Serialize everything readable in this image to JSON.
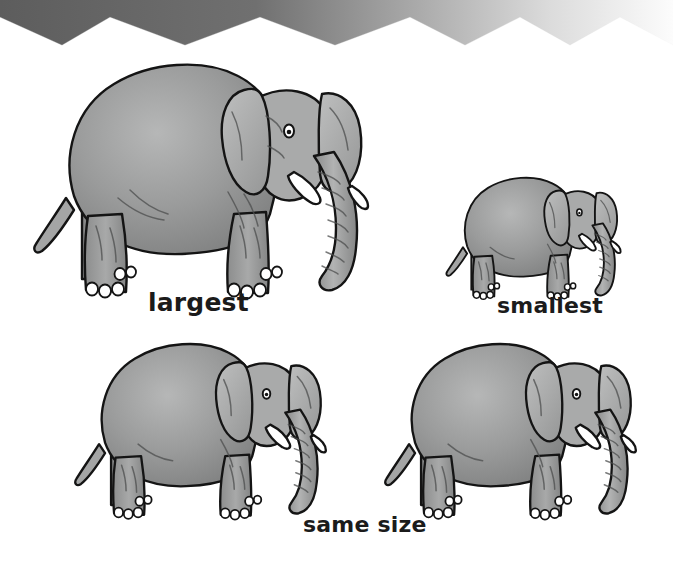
{
  "page": {
    "width": 673,
    "height": 567,
    "background_color": "#ffffff"
  },
  "banner": {
    "name": "zigzag-banner",
    "shape": "zigzag",
    "height": 48,
    "gradient_start_color": "#5f5f5f",
    "gradient_end_color": "#fbfbfb",
    "peak_color": "#ffffff",
    "peak_top_y": 17,
    "valley_y": 42,
    "peak_x_positions": [
      0,
      110,
      260,
      410,
      520,
      620
    ]
  },
  "artwork": {
    "subject": "asian-elephant",
    "style": "pencil-shaded line drawing",
    "outline_color": "#141414",
    "body_fill_color": "#9a9b9b",
    "body_shadow_color": "#7d7e7e",
    "body_highlight_color": "#b5b6b6",
    "ear_fill_color": "#aeafaf",
    "tusk_color": "#ffffff",
    "toenail_color": "#ffffff"
  },
  "figures": [
    {
      "id": "elephant-largest",
      "name": "largest-elephant",
      "label": "largest",
      "relative_scale": 1.0,
      "size_rank": 1,
      "left": 22,
      "top": 46,
      "drawn_width": 345,
      "drawn_height": 262
    },
    {
      "id": "elephant-smallest",
      "name": "smallest-elephant",
      "label": "smallest",
      "relative_scale": 0.52,
      "size_rank": 4,
      "left": 440,
      "top": 168,
      "drawn_width": 180,
      "drawn_height": 137
    },
    {
      "id": "elephant-same-left",
      "name": "same-size-elephant-left",
      "label": "same size",
      "relative_scale": 0.75,
      "size_rank": 2,
      "left": 66,
      "top": 330,
      "drawn_width": 259,
      "drawn_height": 197
    },
    {
      "id": "elephant-same-right",
      "name": "same-size-elephant-right",
      "label": "same size",
      "relative_scale": 0.75,
      "size_rank": 2,
      "left": 376,
      "top": 330,
      "drawn_width": 259,
      "drawn_height": 197
    }
  ],
  "labels": {
    "largest": "largest",
    "smallest": "smallest",
    "same_size": "same size"
  }
}
